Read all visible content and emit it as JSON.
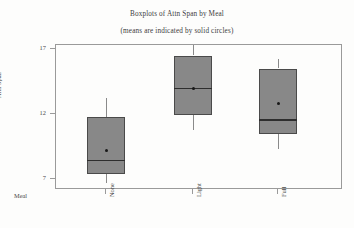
{
  "chart_data": {
    "type": "box",
    "title": "Boxplots of Attn Span by Meal",
    "subtitle": "(means are indicated by solid circles)",
    "xlabel": "Meal",
    "ylabel": "Attn Span",
    "categories": [
      "None",
      "Light",
      "Full"
    ],
    "ylim": [
      6.0,
      18.0
    ],
    "yticks": [
      17,
      12,
      7
    ],
    "ytick_labels": [
      "17",
      "12",
      "7"
    ],
    "grid": false,
    "legend": false,
    "mean_marker": "solid-circle",
    "boxes": [
      {
        "category": "None",
        "whisker_low": 6.7,
        "q1": 7.4,
        "median": 8.5,
        "q3": 11.8,
        "whisker_high": 13.2,
        "mean": 9.2
      },
      {
        "category": "Light",
        "whisker_low": 10.8,
        "q1": 11.9,
        "median": 14.0,
        "q3": 16.5,
        "whisker_high": 17.3,
        "mean": 14.0
      },
      {
        "category": "Full",
        "whisker_low": 9.3,
        "q1": 10.5,
        "median": 11.6,
        "q3": 15.5,
        "whisker_high": 16.2,
        "mean": 12.8
      }
    ],
    "colors": {
      "box_fill": "#888888",
      "box_edge": "#4a4a4a",
      "median": "#2e2e2e",
      "whisker": "#8a8a8a",
      "mean_dot": "#181818",
      "frame": "#9a9a9a",
      "text": "#3c3c3c",
      "background": "#fdfdfc"
    }
  }
}
